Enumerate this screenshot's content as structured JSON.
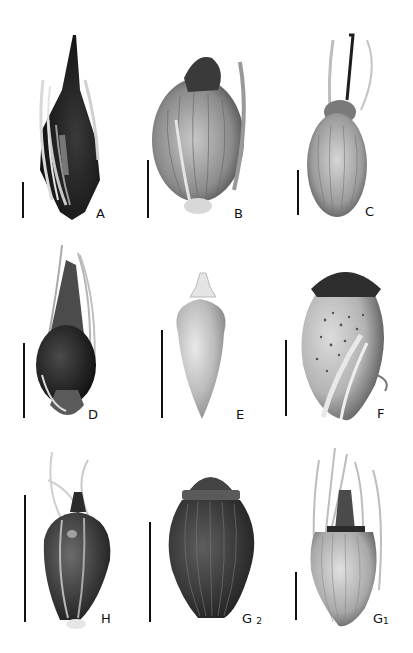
{
  "figure": {
    "type": "botanical seed morphology plate",
    "background": "#ffffff",
    "panels": [
      {
        "id": "A",
        "label": "A",
        "row": 1,
        "col": 1,
        "description": "dark glossy achene enclosed by pale perianth bristles, long tapering beak",
        "tone": "dark"
      },
      {
        "id": "B",
        "label": "B",
        "row": 1,
        "col": 2,
        "description": "ovoid achene with longitudinally ribbed surface, dark cap and barbed bristle",
        "tone": "mid"
      },
      {
        "id": "C",
        "label": "C",
        "row": 1,
        "col": 3,
        "description": "ellipsoid ribbed achene with dark slender style and bristles",
        "tone": "light"
      },
      {
        "id": "D",
        "label": "D",
        "row": 2,
        "col": 1,
        "description": "dark achene with conical beak and long bristles",
        "tone": "dark"
      },
      {
        "id": "E",
        "label": "E",
        "row": 2,
        "col": 2,
        "description": "smooth pale obovoid achene with small tubercle",
        "tone": "pale"
      },
      {
        "id": "F",
        "label": "F",
        "row": 2,
        "col": 3,
        "description": "globose speckled achene with dark flattened cap and curled bristles",
        "tone": "speckled"
      },
      {
        "id": "H",
        "label": "H",
        "row": 3,
        "col": 1,
        "description": "dark ovate achene with pointed tubercle and wavy bristles",
        "tone": "dark"
      },
      {
        "id": "G2",
        "label": "G",
        "label_sub": "2",
        "row": 3,
        "col": 2,
        "description": "dark ribbed achene with rugose surface and rounded cap",
        "tone": "dark"
      },
      {
        "id": "G1",
        "label": "G",
        "label_sub": "1",
        "row": 3,
        "col": 3,
        "description": "pale ribbed achene with conical tubercle and long bristles",
        "tone": "light"
      }
    ]
  }
}
